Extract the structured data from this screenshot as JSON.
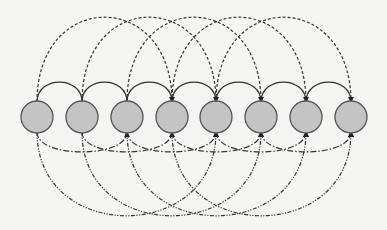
{
  "diagram": {
    "type": "circulant-graph",
    "node_count": 8,
    "node_fill": "#c4c4c4",
    "node_stroke": "#555555",
    "line_color": "#333333",
    "nodes": [
      {
        "id": 0,
        "cx": 37
      },
      {
        "id": 1,
        "cx": 82
      },
      {
        "id": 2,
        "cx": 127
      },
      {
        "id": 3,
        "cx": 172
      },
      {
        "id": 4,
        "cx": 216
      },
      {
        "id": 5,
        "cx": 261
      },
      {
        "id": 6,
        "cx": 306
      },
      {
        "id": 7,
        "cx": 351
      }
    ],
    "node_cy": 117,
    "node_r": 16,
    "arc_groups": [
      {
        "name": "span-1-solid",
        "side": "top",
        "span": 1,
        "style": "solid",
        "peak_y": 82
      },
      {
        "name": "span-3-dashed",
        "side": "top",
        "span": 3,
        "style": "dashed",
        "peak_y": 17
      },
      {
        "name": "span-2-dashdot",
        "side": "bottom",
        "span": 2,
        "style": "dash-dot",
        "trough_y": 152
      },
      {
        "name": "span-4-dashdotdot",
        "side": "bottom",
        "span": 4,
        "style": "dash-dot-dot",
        "trough_y": 216
      }
    ]
  }
}
